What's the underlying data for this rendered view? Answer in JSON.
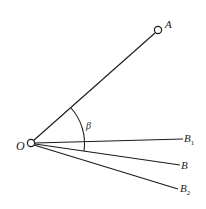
{
  "diagram": {
    "points": {
      "O": {
        "label": "O",
        "x": 31,
        "y": 143
      },
      "A": {
        "label": "A",
        "x": 158,
        "y": 30
      },
      "B1": {
        "label": "B",
        "sub": "1",
        "x": 183,
        "y": 139
      },
      "B": {
        "label": "B",
        "x": 180,
        "y": 165
      },
      "B2": {
        "label": "B",
        "sub": "2",
        "x": 178,
        "y": 188
      }
    },
    "angle": {
      "label": "β",
      "between": [
        "OA",
        "OB"
      ]
    },
    "colors": {
      "line": "#1a1a1a",
      "text": "#222222",
      "background": "#ffffff"
    }
  }
}
